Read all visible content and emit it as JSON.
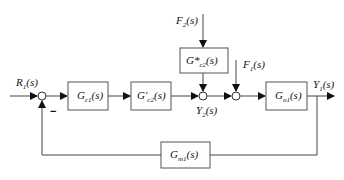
{
  "diagram": {
    "type": "block-diagram",
    "signals": {
      "input": {
        "main": "R",
        "sub": "1",
        "arg": "(s)"
      },
      "output": {
        "main": "Y",
        "sub": "1",
        "arg": "(s)"
      },
      "intermediate": {
        "main": "Y",
        "sub": "2",
        "arg": "(s)"
      },
      "disturbance_2": {
        "main": "F",
        "sub": "2",
        "arg": "(s)"
      },
      "disturbance_1": {
        "main": "F",
        "sub": "1",
        "arg": "(s)"
      }
    },
    "blocks": {
      "gc1": {
        "main": "G",
        "sub": "c1",
        "arg": "(s)"
      },
      "gc2_prime": {
        "main": "G′",
        "sub": "c2",
        "arg": "(s)"
      },
      "gc2_star": {
        "main": "G*",
        "sub": "c2",
        "arg": "(s)"
      },
      "go1": {
        "main": "G",
        "sub": "o1",
        "arg": "(s)"
      },
      "gm1": {
        "main": "G",
        "sub": "m1",
        "arg": "(s)"
      }
    },
    "feedback_sign": "−"
  }
}
